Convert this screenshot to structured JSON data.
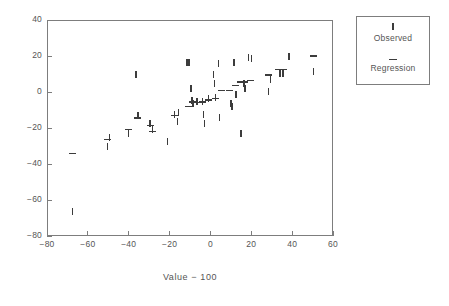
{
  "chart_data": {
    "type": "scatter",
    "title": "",
    "xlabel": "Value − 100",
    "ylabel": "",
    "xlim": [
      -80,
      60
    ],
    "ylim": [
      -80,
      40
    ],
    "xticks": [
      -80,
      -60,
      -40,
      -20,
      0,
      20,
      40,
      60
    ],
    "yticks": [
      -80,
      -60,
      -40,
      -20,
      0,
      20,
      40
    ],
    "xtick_labels": [
      "−80",
      "−60",
      "−40",
      "−20",
      "0",
      "20",
      "40",
      "60"
    ],
    "ytick_labels": [
      "−80",
      "−60",
      "−40",
      "−20",
      "0",
      "20",
      "40"
    ],
    "grid": false,
    "legend_position": "outside-right-top",
    "marker_color": "#3c3c3c",
    "axis_color": "#7d7d7d",
    "series": [
      {
        "name": "Observed",
        "marker": "vertical-bar",
        "points": [
          [
            -67.5,
            -66.5
          ],
          [
            -50.5,
            -30.5
          ],
          [
            -49.5,
            -25.0
          ],
          [
            -40.0,
            -23.0
          ],
          [
            -36.5,
            10.0
          ],
          [
            -35.5,
            -13.0
          ],
          [
            -29.5,
            -17.5
          ],
          [
            -28.5,
            -21.0
          ],
          [
            -21.0,
            -27.5
          ],
          [
            -17.5,
            -12.5
          ],
          [
            -16.0,
            -16.5
          ],
          [
            -15.5,
            -11.5
          ],
          [
            -11.5,
            16.5
          ],
          [
            -10.5,
            16.5
          ],
          [
            -9.5,
            2.0
          ],
          [
            -9.0,
            -4.5
          ],
          [
            -8.5,
            -6.5
          ],
          [
            -6.5,
            -5.5
          ],
          [
            -4.0,
            -5.0
          ],
          [
            -3.5,
            -12.5
          ],
          [
            -3.0,
            -17.5
          ],
          [
            -1.0,
            -3.5
          ],
          [
            1.5,
            9.5
          ],
          [
            2.0,
            5.0
          ],
          [
            2.5,
            -3.0
          ],
          [
            4.0,
            16.0
          ],
          [
            4.5,
            -14.0
          ],
          [
            10.0,
            -6.5
          ],
          [
            10.5,
            -8.0
          ],
          [
            11.5,
            16.5
          ],
          [
            12.5,
            -1.5
          ],
          [
            15.0,
            -23.0
          ],
          [
            16.5,
            4.5
          ],
          [
            17.0,
            2.0
          ],
          [
            18.5,
            19.0
          ],
          [
            20.0,
            18.5
          ],
          [
            28.5,
            0.5
          ],
          [
            29.5,
            7.0
          ],
          [
            34.0,
            10.5
          ],
          [
            35.5,
            10.5
          ],
          [
            38.5,
            20.0
          ],
          [
            50.5,
            11.5
          ]
        ]
      },
      {
        "name": "Regression",
        "marker": "horizontal-dash",
        "points": [
          [
            -67.5,
            -34.0
          ],
          [
            -50.5,
            -26.5
          ],
          [
            -40.0,
            -21.0
          ],
          [
            -35.5,
            -14.5
          ],
          [
            -29.5,
            -18.5
          ],
          [
            -28.5,
            -22.0
          ],
          [
            -17.5,
            -13.0
          ],
          [
            -10.5,
            -8.0
          ],
          [
            -9.0,
            -5.5
          ],
          [
            -6.5,
            -6.0
          ],
          [
            -4.0,
            -5.5
          ],
          [
            -1.0,
            -4.5
          ],
          [
            2.5,
            -3.5
          ],
          [
            5.5,
            1.0
          ],
          [
            9.5,
            1.0
          ],
          [
            12.5,
            3.5
          ],
          [
            14.5,
            5.5
          ],
          [
            16.5,
            5.5
          ],
          [
            19.5,
            6.5
          ],
          [
            28.5,
            9.5
          ],
          [
            33.5,
            12.5
          ],
          [
            36.0,
            12.5
          ],
          [
            50.5,
            20.0
          ]
        ]
      }
    ]
  },
  "legend": {
    "entries": [
      {
        "label": "Observed",
        "marker": "vertical-bar"
      },
      {
        "label": "Regression",
        "marker": "horizontal-dash"
      }
    ]
  }
}
